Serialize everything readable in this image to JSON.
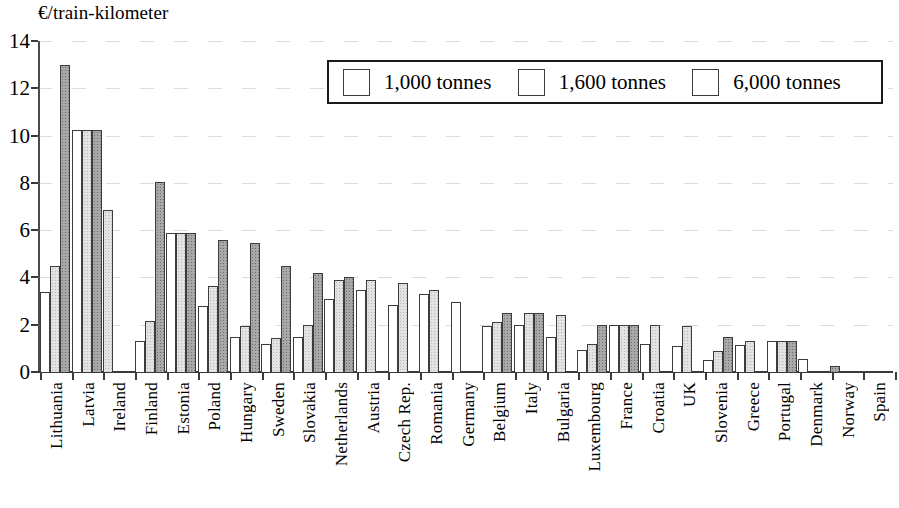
{
  "chart_data": {
    "type": "bar",
    "title": "",
    "ylabel": "€/train-kilometer",
    "xlabel": "",
    "ylim": [
      0,
      14
    ],
    "yticks": [
      0,
      2,
      4,
      6,
      8,
      10,
      12,
      14
    ],
    "grid": true,
    "legend_position": "top-center",
    "series": [
      {
        "name": "1,000 tonnes",
        "color": "#ffffff",
        "fill": "white"
      },
      {
        "name": "1,600 tonnes",
        "color": "#e3e3e3",
        "fill": "light-gray-stipple"
      },
      {
        "name": "6,000 tonnes",
        "color": "#a8a8a8",
        "fill": "dark-gray-stipple"
      }
    ],
    "categories": [
      "Lithuania",
      "Latvia",
      "Ireland",
      "Finland",
      "Estonia",
      "Poland",
      "Hungary",
      "Sweden",
      "Slovakia",
      "Netherlands",
      "Austria",
      "Czech Rep.",
      "Romania",
      "Germany",
      "Belgium",
      "Italy",
      "Bulgaria",
      "Luxembourg",
      "France",
      "Croatia",
      "UK",
      "Slovenia",
      "Greece",
      "Portugal",
      "Denmark",
      "Norway",
      "Spain"
    ],
    "values": {
      "1,000 tonnes": [
        3.4,
        10.25,
        null,
        1.3,
        5.9,
        2.8,
        1.5,
        1.2,
        1.5,
        3.1,
        3.45,
        2.85,
        3.3,
        2.95,
        1.95,
        2.0,
        1.5,
        0.95,
        2.0,
        1.2,
        1.1,
        0.5,
        1.15,
        1.3,
        0.55,
        null,
        0.05
      ],
      "1,600 tonnes": [
        4.5,
        10.25,
        6.85,
        2.15,
        5.9,
        3.65,
        1.95,
        1.45,
        2.0,
        3.9,
        3.9,
        3.75,
        3.45,
        null,
        2.1,
        2.5,
        2.4,
        1.2,
        2.0,
        2.0,
        1.95,
        0.9,
        1.3,
        1.3,
        null,
        null,
        null
      ],
      "6,000 tonnes": [
        13.0,
        10.25,
        null,
        8.05,
        5.9,
        5.6,
        5.45,
        4.5,
        4.2,
        4.0,
        null,
        null,
        null,
        null,
        2.5,
        2.5,
        null,
        2.0,
        2.0,
        null,
        null,
        1.5,
        null,
        1.3,
        null,
        0.25,
        null
      ]
    }
  },
  "legend": {
    "items": [
      {
        "label": "1,000 tonnes",
        "swatch": "white"
      },
      {
        "label": "1,600 tonnes",
        "swatch": "light-gray"
      },
      {
        "label": "6,000 tonnes",
        "swatch": "dark-gray"
      }
    ]
  },
  "axis": {
    "y_title": "€/train-kilometer",
    "y_tick_labels": [
      "0",
      "2",
      "4",
      "6",
      "8",
      "10",
      "12",
      "14"
    ]
  }
}
